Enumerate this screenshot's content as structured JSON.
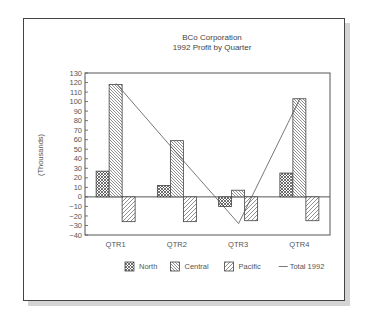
{
  "chart_data": {
    "type": "bar",
    "title": "BCo Corporation",
    "subtitle": "1992 Profit by Quarter",
    "xlabel": "",
    "ylabel": "(Thousands)",
    "ylim": [
      -40,
      130
    ],
    "yticks": [
      130,
      120,
      110,
      100,
      90,
      80,
      70,
      60,
      50,
      40,
      30,
      20,
      10,
      0,
      -10,
      -20,
      -30,
      -40
    ],
    "categories": [
      "QTR1",
      "QTR2",
      "QTR3",
      "QTR4"
    ],
    "series": [
      {
        "name": "North",
        "kind": "bar",
        "pattern": "crosshatch",
        "values": [
          27,
          12,
          -10,
          25
        ]
      },
      {
        "name": "Central",
        "kind": "bar",
        "pattern": "diagonal-back",
        "values": [
          118,
          59,
          7,
          103
        ]
      },
      {
        "name": "Pacific",
        "kind": "bar",
        "pattern": "diagonal-forward",
        "values": [
          -26,
          -26,
          -25,
          -25
        ]
      },
      {
        "name": "Total 1992",
        "kind": "line",
        "values": [
          119,
          45,
          -28,
          103
        ]
      }
    ],
    "grid": false,
    "legend_position": "bottom"
  }
}
